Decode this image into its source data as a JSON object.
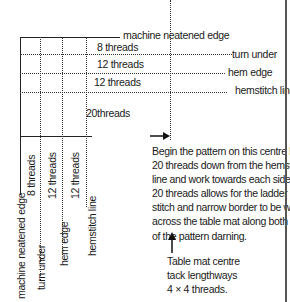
{
  "diagram": {
    "horizontal_labels": {
      "machine_neatened_edge": "machine neatened edge",
      "turn_under": "turn under",
      "hem_edge": "hem edge",
      "hemstitch_line": "hemstitch line"
    },
    "horizontal_thread_counts": {
      "band1": "8 threads",
      "band2": "12 threads",
      "band3": "12 threads",
      "band4": "20threads"
    },
    "vertical_thread_counts": {
      "band1": "8 threads",
      "band2": "12 threads",
      "band3": "12 threads"
    },
    "vertical_labels": {
      "machine_neatened_edge": "machine neatened edge",
      "turn_under": "turn under",
      "hem_edge": "hem edge",
      "hemstitch_line": "hemstitch line"
    },
    "instruction_lines": [
      "Begin  the pattern on this centre line",
      "20 threads down from the hemstitch",
      "line and work towards each side. The",
      "20 threads allows for the ladder hem-",
      "stitch and narrow border to be worked",
      "across the table mat along both sides",
      "of the pattern darning."
    ],
    "centre_note_lines": [
      "Table mat centre",
      "tack lengthways",
      "4 × 4 threads."
    ],
    "colors": {
      "line": "#222222",
      "text": "#1a1a1a",
      "background": "#ffffff"
    }
  }
}
